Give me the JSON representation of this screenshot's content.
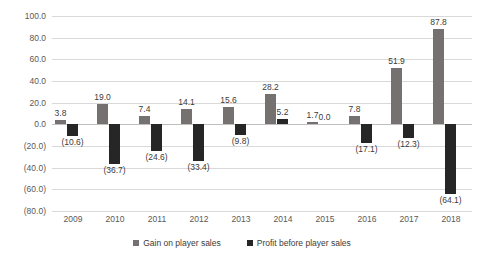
{
  "chart_data": {
    "type": "bar",
    "title": "",
    "subtitle": "",
    "xlabel": "",
    "ylabel": "",
    "grid": true,
    "legend_position": "bottom",
    "ylim": [
      -80.0,
      100.0
    ],
    "ytick_step": 20.0,
    "ytick_labels": [
      "100.0",
      "80.0",
      "60.0",
      "40.0",
      "20.0",
      "0.0",
      "(20.0)",
      "(40.0)",
      "(60.0)",
      "(80.0)"
    ],
    "ytick_values": [
      100.0,
      80.0,
      60.0,
      40.0,
      20.0,
      0.0,
      -20.0,
      -40.0,
      -60.0,
      -80.0
    ],
    "categories": [
      "2009",
      "2010",
      "2011",
      "2012",
      "2013",
      "2014",
      "2015",
      "2016",
      "2017",
      "2018"
    ],
    "series": [
      {
        "name": "Gain on player sales",
        "color": "#767171",
        "values": [
          3.8,
          19.0,
          7.4,
          14.1,
          15.6,
          28.2,
          1.7,
          7.8,
          51.9,
          87.8
        ],
        "labels": [
          "3.8",
          "19.0",
          "7.4",
          "14.1",
          "15.6",
          "28.2",
          "1.7",
          "7.8",
          "51.9",
          "87.8"
        ]
      },
      {
        "name": "Profit before player sales",
        "color": "#262626",
        "values": [
          -10.6,
          -36.7,
          -24.6,
          -33.4,
          -9.8,
          5.2,
          0.0,
          -17.1,
          -12.3,
          -64.1
        ],
        "labels": [
          "(10.6)",
          "(36.7)",
          "(24.6)",
          "(33.4)",
          "(9.8)",
          "5.2",
          "0.0",
          "(17.1)",
          "(12.3)",
          "(64.1)"
        ]
      }
    ]
  },
  "legend": {
    "items": [
      {
        "label": "Gain on player sales"
      },
      {
        "label": "Profit before player sales"
      }
    ]
  }
}
